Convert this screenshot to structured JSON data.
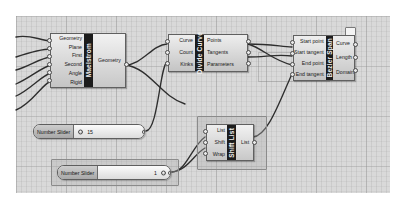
{
  "app": {
    "editor_name": "node-graph-canvas",
    "background_color": "#d9d9d9",
    "grid_color": "#828282"
  },
  "components": [
    {
      "id": "maelstrom",
      "title": "Maelstrom",
      "inputs": [
        "Geometry",
        "Plane",
        "First",
        "Second",
        "Angle",
        "Rigid"
      ],
      "outputs": [
        "Geometry"
      ],
      "selected": false
    },
    {
      "id": "divide-curve",
      "title": "Divide Curve",
      "inputs": [
        "Curve",
        "Count",
        "Kinks"
      ],
      "outputs": [
        "Points",
        "Tangents",
        "Parameters"
      ],
      "selected": false
    },
    {
      "id": "bezier-span",
      "title": "Bezier Span",
      "inputs": [
        "Start point",
        "Start tangent",
        "End point",
        "End tangent"
      ],
      "outputs": [
        "Curve",
        "Length",
        "Domain"
      ],
      "selected": false,
      "badge": true
    },
    {
      "id": "shift-list",
      "title": "Shift List",
      "inputs": [
        "List",
        "Shift",
        "Wrap"
      ],
      "outputs": [
        "List"
      ],
      "selected": true
    }
  ],
  "sliders": [
    {
      "id": "number-slider-top",
      "label": "Number Slider",
      "value": "15",
      "handle_position": "left",
      "selected": false
    },
    {
      "id": "number-slider-bottom",
      "label": "Number Slider",
      "value": "1",
      "handle_position": "right",
      "selected": true
    }
  ]
}
